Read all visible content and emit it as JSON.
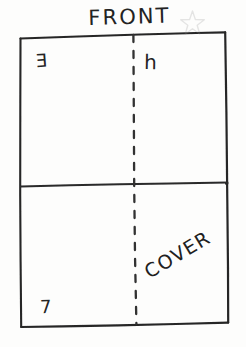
{
  "sketch": {
    "title": "FRONT",
    "background_color": "#fdfdfc",
    "ink_color": "#1c1c1c",
    "star_color": "#9a9a9a",
    "labels": {
      "top_left": "E",
      "top_right": "h",
      "bottom_right": "COVER",
      "bottom_left_number": "7"
    },
    "icons": {
      "star": "star-icon"
    },
    "geometry": {
      "outline": "slightly tilted rectangle",
      "corners": {
        "top_left": [
          20,
          37
        ],
        "top_right": [
          225,
          32
        ],
        "bottom_right": [
          228,
          323
        ],
        "bottom_left": [
          21,
          327
        ]
      },
      "horizontal_divider_y": 185,
      "fold_line_x": 134,
      "fold_line_style": "dashed"
    }
  }
}
